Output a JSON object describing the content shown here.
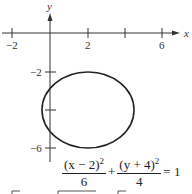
{
  "diagram": {
    "type": "ellipse-graph",
    "axes": {
      "x_label": "x",
      "y_label": "y",
      "x_ticks": [
        {
          "value": -2,
          "label": "−2"
        },
        {
          "value": 2,
          "label": "2"
        },
        {
          "value": 4,
          "label": ""
        },
        {
          "value": 6,
          "label": "6"
        }
      ],
      "y_ticks": [
        {
          "value": -2,
          "label": "−2"
        },
        {
          "value": -4,
          "label": ""
        },
        {
          "value": -6,
          "label": "−6"
        }
      ]
    },
    "ellipse": {
      "center": [
        2,
        -4
      ],
      "a_squared": 6,
      "b_squared": 4,
      "stroke_color": "#222222"
    },
    "equation": {
      "term1_numerator": "(x − 2)",
      "term1_exponent": "2",
      "term1_denominator": "6",
      "plus": "+",
      "term2_numerator": "(y + 4)",
      "term2_exponent": "2",
      "term2_denominator": "4",
      "equals": "= 1"
    }
  }
}
